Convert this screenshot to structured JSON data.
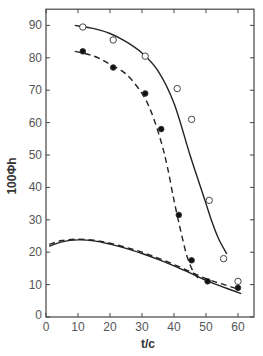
{
  "chart_data": {
    "type": "line",
    "title": "",
    "xlabel": "t/c",
    "ylabel": "100Φh",
    "xlim": [
      0,
      65
    ],
    "ylim": [
      0,
      95
    ],
    "xticks": [
      0,
      10,
      20,
      30,
      40,
      50,
      60
    ],
    "yticks": [
      0,
      10,
      20,
      30,
      40,
      50,
      60,
      70,
      80,
      90
    ],
    "grid": false,
    "legend": null,
    "series": [
      {
        "name": "open circles (data)",
        "kind": "scatter",
        "marker": "open-circle",
        "x": [
          11.5,
          21,
          31,
          41,
          45.5,
          51,
          55.5,
          60
        ],
        "y": [
          89.5,
          85.5,
          80.5,
          70.5,
          61,
          36,
          18,
          11
        ]
      },
      {
        "name": "filled circles (data)",
        "kind": "scatter",
        "marker": "filled-circle",
        "x": [
          11.5,
          21,
          31,
          36,
          41.5,
          45.5,
          50.5,
          60
        ],
        "y": [
          82,
          77,
          69,
          58,
          31.5,
          17.5,
          11,
          9
        ]
      },
      {
        "name": "upper solid curve",
        "kind": "line",
        "style": "solid",
        "x": [
          9,
          15,
          20,
          25,
          30,
          35,
          40,
          45,
          48,
          50,
          52,
          54,
          56.5
        ],
        "y": [
          90,
          89,
          87.5,
          85,
          81.5,
          76,
          66,
          50,
          41,
          35,
          29,
          24,
          19.5
        ]
      },
      {
        "name": "upper dashed curve",
        "kind": "line",
        "style": "dashed",
        "x": [
          9,
          15,
          20,
          25,
          30,
          33,
          36,
          38,
          40,
          42,
          44,
          46,
          47.5
        ],
        "y": [
          82,
          80.5,
          78,
          75,
          69,
          63,
          54,
          46,
          36,
          27,
          19,
          14,
          12
        ]
      },
      {
        "name": "lower solid curve",
        "kind": "line",
        "style": "solid",
        "x": [
          1,
          5,
          10,
          15,
          20,
          25,
          30,
          35,
          40,
          45,
          50,
          55,
          61
        ],
        "y": [
          21.8,
          23.2,
          23.8,
          23.5,
          22.5,
          21.2,
          19.6,
          17.8,
          15.8,
          13.6,
          11.3,
          9.4,
          7.2
        ]
      },
      {
        "name": "lower dashed curve",
        "kind": "line",
        "style": "dashed",
        "x": [
          1,
          5,
          10,
          15,
          20,
          25,
          30,
          35,
          40,
          45,
          50,
          55,
          60
        ],
        "y": [
          22.4,
          23.6,
          24.0,
          23.7,
          22.8,
          21.5,
          20.0,
          18.2,
          16.2,
          14.0,
          11.8,
          10.2,
          8.6
        ]
      }
    ]
  }
}
